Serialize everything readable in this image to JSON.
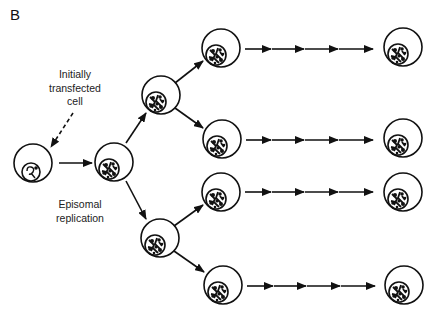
{
  "figure": {
    "panel_label": "B",
    "labels": {
      "initially_transfected": [
        "Initially",
        "transfected",
        "cell"
      ],
      "episomal_replication": [
        "Episomal",
        "replication"
      ]
    },
    "colors": {
      "stroke": "#111111",
      "background": "#ffffff"
    }
  },
  "diagram": {
    "nodes": [
      {
        "id": "initial-cell",
        "type": "transfected-cell",
        "cx": 33,
        "cy": 163
      },
      {
        "id": "gen1-cell",
        "cx": 114,
        "cy": 162
      },
      {
        "id": "gen2-top-cell",
        "cx": 161,
        "cy": 95
      },
      {
        "id": "gen2-bottom-cell",
        "cx": 160,
        "cy": 238
      },
      {
        "id": "row1-start-cell",
        "cx": 221,
        "cy": 48
      },
      {
        "id": "row2-start-cell",
        "cx": 222,
        "cy": 139
      },
      {
        "id": "row3-start-cell",
        "cx": 221,
        "cy": 192
      },
      {
        "id": "row4-start-cell",
        "cx": 223,
        "cy": 285
      },
      {
        "id": "row1-end-cell",
        "cx": 403,
        "cy": 47
      },
      {
        "id": "row2-end-cell",
        "cx": 403,
        "cy": 138
      },
      {
        "id": "row3-end-cell",
        "cx": 403,
        "cy": 192
      },
      {
        "id": "row4-end-cell",
        "cx": 404,
        "cy": 285
      }
    ],
    "edges": [
      {
        "from": "initial-cell",
        "to": "gen1-cell"
      },
      {
        "from": "gen1-cell",
        "to": "gen2-top-cell"
      },
      {
        "from": "gen1-cell",
        "to": "gen2-bottom-cell"
      },
      {
        "from": "gen2-top-cell",
        "to": "row1-start-cell"
      },
      {
        "from": "gen2-top-cell",
        "to": "row2-start-cell"
      },
      {
        "from": "gen2-bottom-cell",
        "to": "row3-start-cell"
      },
      {
        "from": "gen2-bottom-cell",
        "to": "row4-start-cell"
      },
      {
        "from": "row1-start-cell",
        "to": "row1-end-cell",
        "style": "chain-of-4-arrows"
      },
      {
        "from": "row2-start-cell",
        "to": "row2-end-cell",
        "style": "chain-of-4-arrows"
      },
      {
        "from": "row3-start-cell",
        "to": "row3-end-cell",
        "style": "chain-of-4-arrows"
      },
      {
        "from": "row4-start-cell",
        "to": "row4-end-cell",
        "style": "chain-of-4-arrows"
      }
    ],
    "annotation_arrow": {
      "style": "dashed",
      "points_to": "initial-cell"
    }
  }
}
